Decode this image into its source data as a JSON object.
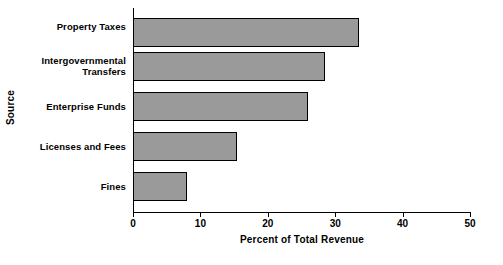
{
  "chart_data": {
    "type": "bar",
    "orientation": "horizontal",
    "title": "",
    "xlabel": "Percent of Total Revenue",
    "ylabel": "Source",
    "categories": [
      "Property Taxes",
      "Intergovernmental Transfers",
      "Enterprise Funds",
      "Licenses and Fees",
      "Fines"
    ],
    "values": [
      33.5,
      28.5,
      26,
      15.5,
      8
    ],
    "xlim": [
      0,
      50
    ],
    "xticks": [
      0,
      10,
      20,
      30,
      40,
      50
    ],
    "xtick_labels": [
      "0",
      "10",
      "20",
      "30",
      "40",
      "50"
    ],
    "grid": false,
    "legend": false,
    "bar_fill_color": "#9a9a9a",
    "bar_edge_color": "#000000",
    "background_color": "#ffffff"
  },
  "category_label_lines": [
    [
      "Property Taxes"
    ],
    [
      "Intergovernmental",
      "Transfers"
    ],
    [
      "Enterprise Funds"
    ],
    [
      "Licenses and Fees"
    ],
    [
      "Fines"
    ]
  ]
}
